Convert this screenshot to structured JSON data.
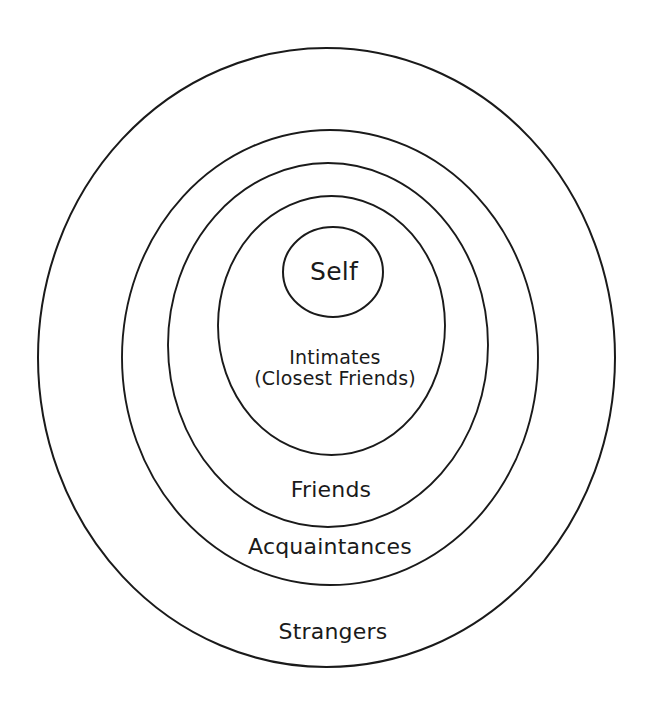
{
  "diagram": {
    "type": "concentric-circles",
    "background_color": "#ffffff",
    "stroke_color": "#1a1a1a",
    "text_color": "#1a1a1a",
    "rings": [
      {
        "id": "strangers",
        "label": "Strangers",
        "level": 5,
        "cx": 326.5,
        "cy": 357.5,
        "rx": 288.5,
        "ry": 309.5,
        "stroke_width": 2.0,
        "label_x": 333,
        "label_y": 632
      },
      {
        "id": "acquaintances",
        "label": "Acquaintances",
        "level": 4,
        "cx": 330,
        "cy": 357.5,
        "rx": 208,
        "ry": 227.5,
        "stroke_width": 1.9,
        "label_x": 330,
        "label_y": 547
      },
      {
        "id": "friends",
        "label": "Friends",
        "level": 3,
        "cx": 328,
        "cy": 345,
        "rx": 160,
        "ry": 182,
        "stroke_width": 1.9,
        "label_x": 331,
        "label_y": 490
      },
      {
        "id": "intimates",
        "label": "Intimates",
        "label_line2": "(Closest Friends)",
        "level": 2,
        "cx": 331.5,
        "cy": 325.5,
        "rx": 113.5,
        "ry": 129.5,
        "stroke_width": 1.9,
        "label_x": 335,
        "label_y": 368
      },
      {
        "id": "self",
        "label": "Self",
        "level": 1,
        "cx": 333,
        "cy": 272,
        "rx": 50,
        "ry": 45,
        "stroke_width": 2.0,
        "label_x": 334,
        "label_y": 272
      }
    ]
  },
  "labels": {
    "self": "Self",
    "intimates_line1": "Intimates",
    "intimates_line2": "(Closest Friends)",
    "friends": "Friends",
    "acquaintances": "Acquaintances",
    "strangers": "Strangers"
  }
}
